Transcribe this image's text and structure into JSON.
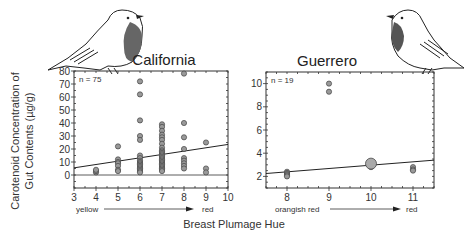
{
  "figure": {
    "ylabel_line1": "Carotenoid Concentration of",
    "ylabel_line2": "Gut Contents (µg/g)",
    "xlabel": "Breast Plumage Hue"
  },
  "chart_data": [
    {
      "type": "scatter",
      "title": "California",
      "annotation": "n = 75",
      "xlim": [
        3,
        10
      ],
      "ylim": [
        -10,
        80
      ],
      "xticks": [
        3,
        4,
        5,
        6,
        7,
        8,
        9,
        10
      ],
      "yticks": [
        0,
        10,
        20,
        30,
        40,
        50,
        60,
        70,
        80
      ],
      "x_scale_labels": {
        "left": "yellow",
        "right": "red"
      },
      "points": [
        [
          4,
          2
        ],
        [
          4,
          3
        ],
        [
          4,
          4
        ],
        [
          5,
          22
        ],
        [
          5,
          12
        ],
        [
          5,
          10
        ],
        [
          5,
          9
        ],
        [
          5,
          7
        ],
        [
          5,
          4
        ],
        [
          5,
          3
        ],
        [
          6,
          72
        ],
        [
          6,
          62
        ],
        [
          6,
          42
        ],
        [
          6,
          30
        ],
        [
          6,
          27
        ],
        [
          6,
          15
        ],
        [
          6,
          13
        ],
        [
          6,
          11
        ],
        [
          6,
          10
        ],
        [
          6,
          9
        ],
        [
          6,
          8
        ],
        [
          6,
          7
        ],
        [
          6,
          6
        ],
        [
          6,
          5
        ],
        [
          6,
          4
        ],
        [
          6,
          3
        ],
        [
          6,
          2
        ],
        [
          7,
          39
        ],
        [
          7,
          37
        ],
        [
          7,
          34
        ],
        [
          7,
          31
        ],
        [
          7,
          29
        ],
        [
          7,
          27
        ],
        [
          7,
          24
        ],
        [
          7,
          21
        ],
        [
          7,
          19
        ],
        [
          7,
          18
        ],
        [
          7,
          17
        ],
        [
          7,
          16
        ],
        [
          7,
          15
        ],
        [
          7,
          14
        ],
        [
          7,
          13
        ],
        [
          7,
          12
        ],
        [
          7,
          11
        ],
        [
          7,
          10
        ],
        [
          7,
          9
        ],
        [
          7,
          8
        ],
        [
          7,
          7
        ],
        [
          7,
          6
        ],
        [
          7,
          5
        ],
        [
          7,
          4
        ],
        [
          7,
          3
        ],
        [
          8,
          78
        ],
        [
          8,
          40
        ],
        [
          8,
          29
        ],
        [
          8,
          20
        ],
        [
          8,
          13
        ],
        [
          8,
          11
        ],
        [
          8,
          9
        ],
        [
          8,
          7
        ],
        [
          8,
          5
        ],
        [
          9,
          25
        ],
        [
          9,
          5
        ],
        [
          9,
          2
        ]
      ],
      "regression": {
        "x": [
          3,
          10
        ],
        "y": [
          5.5,
          23.5
        ]
      }
    },
    {
      "type": "scatter",
      "title": "Guerrero",
      "annotation": "n = 19",
      "xlim": [
        7.5,
        11.5
      ],
      "ylim": [
        1,
        11
      ],
      "xticks": [
        8,
        9,
        10,
        11
      ],
      "yticks": [
        2,
        4,
        6,
        8,
        10
      ],
      "x_scale_labels": {
        "left": "orangish red",
        "right": "red"
      },
      "points": [
        [
          8,
          2.4
        ],
        [
          8,
          2.3
        ],
        [
          8,
          2.2
        ],
        [
          8,
          2.1
        ],
        [
          8,
          2.0
        ],
        [
          9,
          10.0
        ],
        [
          9,
          9.3
        ],
        [
          10,
          3.1
        ],
        [
          10,
          3.0
        ],
        [
          10,
          2.9
        ],
        [
          10,
          2.8
        ],
        [
          11,
          2.8
        ],
        [
          11,
          2.6
        ],
        [
          11,
          2.5
        ]
      ],
      "big_points": [
        [
          10,
          3.1
        ]
      ],
      "regression": {
        "x": [
          7.5,
          11.5
        ],
        "y": [
          2.25,
          3.4
        ]
      }
    }
  ]
}
